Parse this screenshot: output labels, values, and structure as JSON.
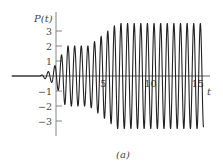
{
  "figure": {
    "caption": "(a)"
  },
  "chart_data": {
    "type": "line",
    "title": "",
    "xlabel": "t",
    "ylabel": "P(t)",
    "xlim": [
      -5,
      17
    ],
    "ylim": [
      -4,
      4
    ],
    "x_ticks": [
      5,
      10,
      15
    ],
    "x_tick_labels": [
      "5",
      "10",
      "15"
    ],
    "y_ticks": [
      -3,
      -2,
      -1,
      1,
      2,
      3
    ],
    "y_tick_labels": [
      "−3",
      "−2",
      "−1",
      "1",
      "2",
      "3"
    ],
    "grid": false,
    "legend": null,
    "series": [
      {
        "name": "P(t)",
        "description": "Oscillating signal: zero before t≈-1.7, small transient wiggle, amplitude rises to ~2 by t≈1, holds ~2 until t≈3.5, ramps to ~3.5 by t≈6.5, then holds ~3.5 until t≈15.5",
        "period": 0.7,
        "envelope": {
          "t": [
            -5,
            -1.7,
            -0.5,
            0.3,
            1.0,
            3.5,
            6.5,
            15.6
          ],
          "amp": [
            0,
            0,
            0.4,
            1.0,
            2.0,
            2.0,
            3.5,
            3.5
          ]
        }
      }
    ],
    "colors": {
      "line": "#222222",
      "axis": "#555555",
      "text": "#444444"
    }
  }
}
